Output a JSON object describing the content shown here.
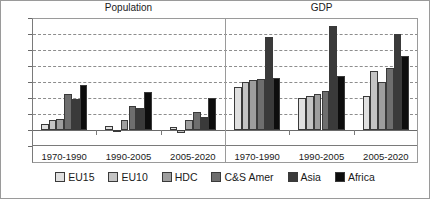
{
  "chart_data": {
    "type": "bar",
    "title": "",
    "panels": [
      {
        "label": "Population",
        "categories": [
          "1970-1990",
          "1990-2005",
          "2005-2020"
        ]
      },
      {
        "label": "GDP",
        "categories": [
          "1970-1990",
          "1990-2005",
          "2005-2020"
        ]
      }
    ],
    "categories": [
      "1970-1990",
      "1990-2005",
      "2005-2020",
      "1970-1990",
      "1990-2005",
      "2005-2020"
    ],
    "series": [
      {
        "name": "EU15",
        "color": "#e0e0e0",
        "values": [
          0.35,
          0.25,
          0.2,
          2.7,
          2.0,
          2.1
        ]
      },
      {
        "name": "EU10",
        "color": "#c4c4c4",
        "values": [
          0.6,
          -0.05,
          -0.2,
          3.0,
          2.15,
          3.7
        ]
      },
      {
        "name": "HDC",
        "color": "#9e9e9e",
        "values": [
          0.7,
          0.6,
          0.65,
          3.15,
          2.25,
          3.0
        ]
      },
      {
        "name": "C&S Amer",
        "color": "#6e6e6e",
        "values": [
          2.25,
          1.5,
          1.1,
          3.2,
          2.45,
          3.9
        ]
      },
      {
        "name": "Asia",
        "color": "#3a3a3a",
        "values": [
          1.95,
          1.35,
          0.8,
          5.8,
          6.5,
          6.0
        ]
      },
      {
        "name": "Africa",
        "color": "#0d0d0d",
        "values": [
          2.8,
          2.4,
          2.0,
          3.25,
          3.4,
          4.6
        ]
      }
    ],
    "ylabel": "",
    "xlabel": "",
    "ylim": [
      -1,
      7
    ],
    "yticks": [
      -1,
      0,
      1,
      2,
      3,
      4,
      5,
      6,
      7
    ],
    "ytick_labels": [
      "-1",
      "0",
      "1",
      "2",
      "3",
      "4",
      "5",
      "6",
      "7"
    ],
    "grid": true,
    "legend_position": "bottom"
  }
}
